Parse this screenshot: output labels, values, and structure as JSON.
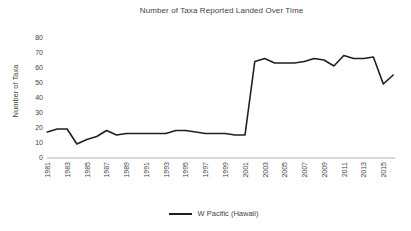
{
  "colors": {
    "line": "#1f1f1f",
    "text": "#3f3f3f",
    "axis": "#b3b3b3"
  },
  "chart_data": {
    "type": "line",
    "title": "Number of Taxa Reported Landed Over Time",
    "xlabel": "",
    "ylabel": "Number of Taxa",
    "x": [
      1981,
      1982,
      1983,
      1984,
      1985,
      1986,
      1987,
      1988,
      1989,
      1990,
      1991,
      1992,
      1993,
      1994,
      1995,
      1996,
      1997,
      1998,
      1999,
      2000,
      2001,
      2002,
      2003,
      2004,
      2005,
      2006,
      2007,
      2008,
      2009,
      2010,
      2011,
      2012,
      2013,
      2014,
      2015,
      2016
    ],
    "series": [
      {
        "name": "W Pacific (Hawaii)",
        "color": "#1f1f1f",
        "values": [
          17,
          19,
          19,
          9,
          12,
          14,
          18,
          15,
          16,
          16,
          16,
          16,
          16,
          18,
          18,
          17,
          16,
          16,
          16,
          15,
          15,
          64,
          66,
          63,
          63,
          63,
          64,
          66,
          65,
          61,
          68,
          66,
          66,
          67,
          49,
          55
        ]
      }
    ],
    "ylim": [
      0,
      80
    ],
    "ytick_step": 10,
    "xtick_labels": [
      "1981",
      "1983",
      "1985",
      "1987",
      "1989",
      "1991",
      "1993",
      "1995",
      "1997",
      "1999",
      "2001",
      "2003",
      "2005",
      "2007",
      "2009",
      "2011",
      "2013",
      "2015"
    ],
    "grid": false,
    "legend_position": "bottom"
  }
}
